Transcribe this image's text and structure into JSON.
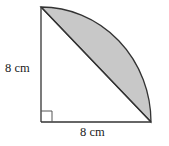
{
  "diagram": {
    "type": "quarter-circle-segment",
    "labels": {
      "vertical_side": "8 cm",
      "horizontal_side": "8 cm"
    },
    "colors": {
      "shaded_segment": "#c8c8c8",
      "stroke": "#333333"
    },
    "right_angle_marker": true
  }
}
